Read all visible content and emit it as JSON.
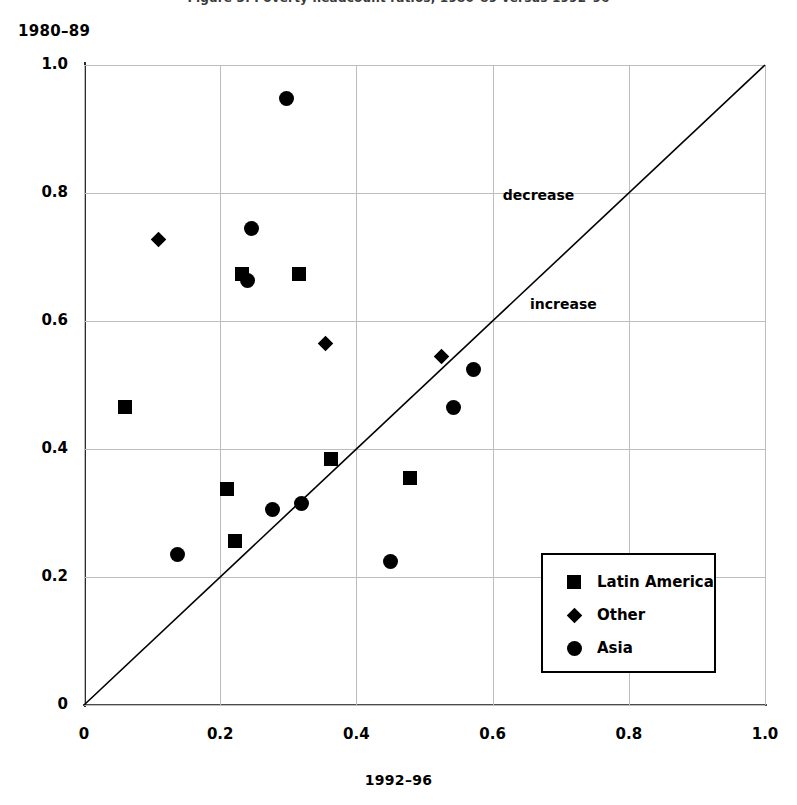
{
  "top_caption_sliver": "Figure 3. Poverty headcount ratios, 1980–89 versus 1992–96",
  "axes": {
    "y_title": "1980–89",
    "x_title": "1992–96",
    "x_ticks": [
      "0",
      "0.2",
      "0.4",
      "0.6",
      "0.8",
      "1.0"
    ],
    "y_ticks": [
      "0",
      "0.2",
      "0.4",
      "0.6",
      "0.8",
      "1.0"
    ],
    "x_tick_values": [
      0,
      0.2,
      0.4,
      0.6,
      0.8,
      1.0
    ],
    "y_tick_values": [
      0,
      0.2,
      0.4,
      0.6,
      0.8,
      1.0
    ]
  },
  "annotations": [
    {
      "text": "decrease",
      "x": 0.615,
      "y": 0.795
    },
    {
      "text": "increase",
      "x": 0.655,
      "y": 0.625
    }
  ],
  "legend": {
    "entries": [
      {
        "label": "Latin America",
        "marker": "square"
      },
      {
        "label": "Other",
        "marker": "diamond"
      },
      {
        "label": "Asia",
        "marker": "circle"
      }
    ]
  },
  "chart_data": {
    "type": "scatter",
    "title": "",
    "xlabel": "1992–96",
    "ylabel": "1980–89",
    "xlim": [
      0,
      1.0
    ],
    "ylim": [
      0,
      1.0
    ],
    "grid": true,
    "legend_position": "bottom-right",
    "reference_line": {
      "label": "45-degree line",
      "from": [
        0,
        0
      ],
      "to": [
        1.0,
        1.0
      ],
      "above_label": "decrease",
      "below_label": "increase"
    },
    "series": [
      {
        "name": "Latin America",
        "marker": "square",
        "points": [
          [
            0.06,
            0.465
          ],
          [
            0.21,
            0.337
          ],
          [
            0.222,
            0.256
          ],
          [
            0.232,
            0.673
          ],
          [
            0.315,
            0.673
          ],
          [
            0.363,
            0.385
          ],
          [
            0.478,
            0.355
          ]
        ]
      },
      {
        "name": "Other",
        "marker": "diamond",
        "points": [
          [
            0.109,
            0.727
          ],
          [
            0.355,
            0.565
          ],
          [
            0.525,
            0.545
          ]
        ]
      },
      {
        "name": "Asia",
        "marker": "circle",
        "points": [
          [
            0.137,
            0.235
          ],
          [
            0.24,
            0.663
          ],
          [
            0.246,
            0.745
          ],
          [
            0.277,
            0.305
          ],
          [
            0.298,
            0.948
          ],
          [
            0.32,
            0.315
          ],
          [
            0.45,
            0.225
          ],
          [
            0.543,
            0.465
          ],
          [
            0.572,
            0.525
          ]
        ]
      }
    ]
  }
}
